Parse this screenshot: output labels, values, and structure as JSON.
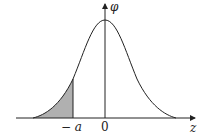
{
  "figure": {
    "type": "normal-distribution-curve",
    "y_axis_label": "φ",
    "x_axis_label": "z",
    "tick_labels": {
      "neg_a": "− a",
      "zero": "0"
    },
    "shaded_region": "left tail, z < −a",
    "colors": {
      "curve": "#222222",
      "axes": "#222222",
      "shade": "#b0b0b0"
    }
  }
}
